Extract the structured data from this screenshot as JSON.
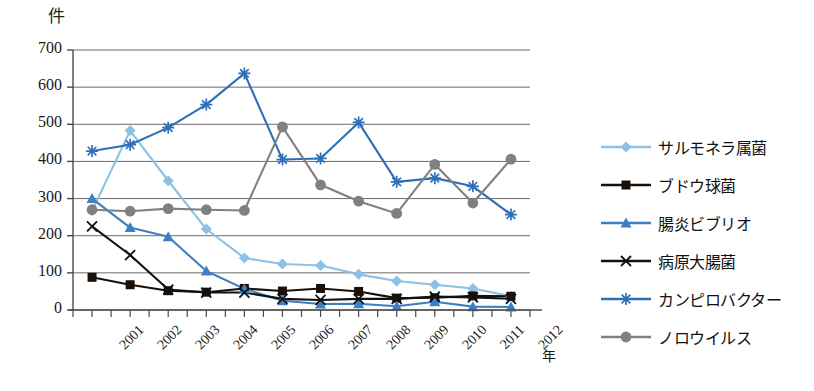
{
  "chart_data": {
    "type": "line",
    "title": "",
    "ylabel": "件",
    "xlabel": "年",
    "grid": true,
    "legend_position": "right",
    "ylim": [
      0,
      700
    ],
    "ytick_values": [
      0,
      100,
      200,
      300,
      400,
      500,
      600,
      700
    ],
    "ytick_labels": [
      "0",
      "100",
      "200",
      "300",
      "400",
      "500",
      "600",
      "700"
    ],
    "categories": [
      "2001",
      "2002",
      "2003",
      "2004",
      "2005",
      "2006",
      "2007",
      "2008",
      "2009",
      "2010",
      "2011",
      "2012"
    ],
    "series": [
      {
        "name": "サルモネラ属菌",
        "color": "#8CC0E4",
        "marker": "diamond",
        "values": [
          267,
          483,
          348,
          218,
          140,
          124,
          120,
          96,
          78,
          68,
          58,
          37
        ]
      },
      {
        "name": "ブドウ球菌",
        "color": "#1a1008",
        "marker": "square",
        "values": [
          88,
          68,
          52,
          48,
          58,
          51,
          58,
          50,
          32,
          33,
          38,
          37
        ]
      },
      {
        "name": "腸炎ビブリオ",
        "color": "#3D7FC1",
        "marker": "triangle",
        "values": [
          300,
          222,
          197,
          105,
          57,
          25,
          16,
          17,
          10,
          22,
          9,
          8
        ]
      },
      {
        "name": "病原大腸菌",
        "color": "#111111",
        "marker": "x",
        "values": [
          225,
          148,
          55,
          47,
          47,
          30,
          27,
          30,
          30,
          36,
          34,
          30
        ]
      },
      {
        "name": "カンピロバクター",
        "color": "#2E6FB7",
        "marker": "star",
        "values": [
          428,
          445,
          491,
          553,
          637,
          405,
          408,
          505,
          345,
          355,
          333,
          257
        ]
      },
      {
        "name": "ノロウイルス",
        "color": "#808080",
        "marker": "circle",
        "values": [
          270,
          266,
          273,
          270,
          268,
          493,
          337,
          293,
          260,
          392,
          288,
          406
        ]
      }
    ]
  },
  "axis": {
    "unit_y": "件",
    "unit_x": "年"
  }
}
